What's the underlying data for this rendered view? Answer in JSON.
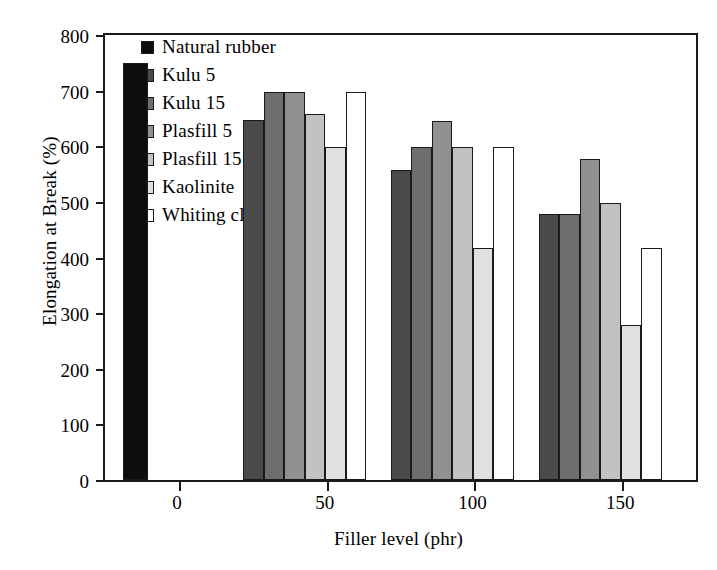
{
  "chart_data": {
    "type": "bar",
    "title": "",
    "xlabel": "Filler level (phr)",
    "ylabel": "Elongation at Break (%)",
    "categories": [
      "0",
      "50",
      "100",
      "150"
    ],
    "xtick_labels": [
      "0",
      "50",
      "100",
      "150"
    ],
    "ytick_labels": [
      "0",
      "100",
      "200",
      "300",
      "400",
      "500",
      "600",
      "700",
      "800"
    ],
    "ylim": [
      0,
      800
    ],
    "ytick_step": 100,
    "grid": false,
    "legend_position": "upper-left-inside",
    "series": [
      {
        "name": "Natural rubber",
        "color": "#0d0d0d",
        "values": [
          750,
          null,
          null,
          null
        ]
      },
      {
        "name": "Kulu 5",
        "color": "#4a4a4a",
        "values": [
          null,
          648,
          558,
          478
        ]
      },
      {
        "name": "Kulu 15",
        "color": "#6e6e6e",
        "values": [
          null,
          698,
          598,
          478
        ]
      },
      {
        "name": "Plasfill 5",
        "color": "#909090",
        "values": [
          null,
          698,
          645,
          578
        ]
      },
      {
        "name": "Plasfill 15",
        "color": "#c2c2c2",
        "values": [
          null,
          658,
          598,
          498
        ]
      },
      {
        "name": "Kaolinite",
        "color": "#e0e0e0",
        "values": [
          null,
          598,
          418,
          278
        ]
      },
      {
        "name": "Whiting clay",
        "color": "#ffffff",
        "values": [
          null,
          698,
          598,
          418
        ]
      }
    ]
  }
}
